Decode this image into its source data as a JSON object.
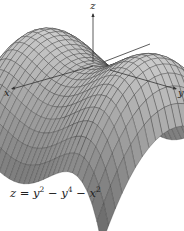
{
  "figure": {
    "type": "3d-surface-plot",
    "equation": {
      "lhs": "z",
      "terms": [
        {
          "sign": "",
          "var": "y",
          "exp": "2"
        },
        {
          "sign": "−",
          "var": "y",
          "exp": "4"
        },
        {
          "sign": "−",
          "var": "x",
          "exp": "2"
        }
      ],
      "text": "z = y² − y⁴ − x²"
    },
    "axes": {
      "x_label": "x",
      "y_label": "y",
      "z_label": "z"
    },
    "colors": {
      "surface_light": "#c8c8c8",
      "surface_dark": "#6e6e6e",
      "mesh_line": "#3a3a3a",
      "axis": "#333333",
      "background": "#ffffff"
    },
    "domain": {
      "x": [
        -1,
        1
      ],
      "y": [
        -1.15,
        1.15
      ]
    },
    "grid": {
      "nx": 22,
      "ny": 34
    }
  }
}
